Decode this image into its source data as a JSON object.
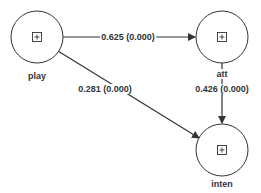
{
  "colors": {
    "stroke": "#333333",
    "background": "#ffffff"
  },
  "nodes": [
    {
      "id": "play",
      "label": "play",
      "icon": "expand-plus-icon"
    },
    {
      "id": "att",
      "label": "att",
      "icon": "expand-plus-icon"
    },
    {
      "id": "inten",
      "label": "inten",
      "icon": "expand-plus-icon"
    }
  ],
  "edges": [
    {
      "from": "play",
      "to": "att",
      "label": "0.625 (0.000)"
    },
    {
      "from": "play",
      "to": "inten",
      "label": "0.281 (0.000)"
    },
    {
      "from": "att",
      "to": "inten",
      "label": "0.426 (0.000)"
    }
  ]
}
